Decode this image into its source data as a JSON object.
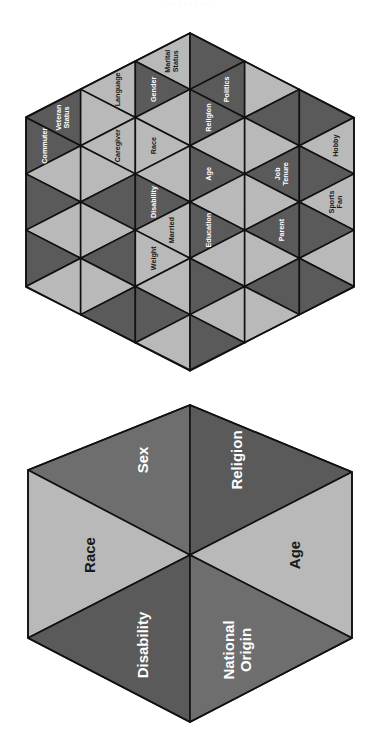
{
  "caption": "· · · · · · · · · ·",
  "colors": {
    "dark": "#5a5a5a",
    "mid": "#6e6e6e",
    "light": "#b9b9b9",
    "stroke": "#111111",
    "text_on_dark": "#ffffff",
    "text_on_light": "#1a1a1a"
  },
  "small_hexagon": {
    "title": "Diversity dimensions (extended)",
    "cells": [
      {
        "label": "Language",
        "shade": "light"
      },
      {
        "label": "Veteran Status",
        "shade": "dark"
      },
      {
        "label": "Caregiver",
        "shade": "light"
      },
      {
        "label": "Commuter",
        "shade": "dark"
      },
      {
        "label": "Homeowner",
        "shade": "light"
      },
      {
        "label": "Marital Status",
        "shade": "light"
      },
      {
        "label": "Gender",
        "shade": "dark"
      },
      {
        "label": "Race",
        "shade": "light"
      },
      {
        "label": "Disability",
        "shade": "dark"
      },
      {
        "label": "Married",
        "shade": "light"
      },
      {
        "label": "Union",
        "shade": "dark"
      },
      {
        "label": "Weight",
        "shade": "light"
      },
      {
        "label": "Politics",
        "shade": "dark"
      },
      {
        "label": "National Origin",
        "shade": "light"
      },
      {
        "label": "Religion",
        "shade": "dark"
      },
      {
        "label": "Sexual Preference",
        "shade": "light"
      },
      {
        "label": "Age",
        "shade": "dark"
      },
      {
        "label": "Birth Order",
        "shade": "light"
      },
      {
        "label": "Education",
        "shade": "dark"
      },
      {
        "label": "Economic Level",
        "shade": "dark"
      },
      {
        "label": "Hobby",
        "shade": "light"
      },
      {
        "label": "Job Tenure",
        "shade": "dark"
      },
      {
        "label": "Sports Fan",
        "shade": "light"
      },
      {
        "label": "Parent",
        "shade": "dark"
      }
    ]
  },
  "large_hexagon": {
    "title": "Protected classes",
    "cells": [
      {
        "label": "Sex",
        "shade": "mid"
      },
      {
        "label": "Race",
        "shade": "light"
      },
      {
        "label": "Disability",
        "shade": "dark"
      },
      {
        "label": "National Origin",
        "shade": "mid"
      },
      {
        "label": "Age",
        "shade": "light"
      },
      {
        "label": "Religion",
        "shade": "dark"
      }
    ]
  }
}
